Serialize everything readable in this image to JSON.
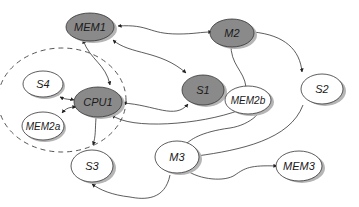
{
  "diagram": {
    "colors": {
      "filled_node": "#8a8a8a",
      "empty_node": "#ffffff",
      "stroke": "#333333",
      "shadow": "#b5b5b5",
      "cluster_border": "#555555"
    },
    "cluster": {
      "name": "cpu1-cluster",
      "members": [
        "S4",
        "CPU1",
        "MEM2a"
      ],
      "style": "dashed"
    },
    "nodes": {
      "MEM1": {
        "label": "MEM1",
        "filled": true
      },
      "M2": {
        "label": "M2",
        "filled": true
      },
      "S4": {
        "label": "S4",
        "filled": false
      },
      "CPU1": {
        "label": "CPU1",
        "filled": true
      },
      "S1": {
        "label": "S1",
        "filled": true
      },
      "MEM2b": {
        "label": "MEM2b",
        "filled": false
      },
      "S2": {
        "label": "S2",
        "filled": false
      },
      "MEM2a": {
        "label": "MEM2a",
        "filled": false
      },
      "S3": {
        "label": "S3",
        "filled": false
      },
      "M3": {
        "label": "M3",
        "filled": false
      },
      "MEM3": {
        "label": "MEM3",
        "filled": false
      }
    },
    "edges": [
      {
        "from": "MEM1",
        "to": "M2",
        "bidirectional": true
      },
      {
        "from": "MEM1",
        "to": "CPU1",
        "bidirectional": true
      },
      {
        "from": "MEM1",
        "to": "S1",
        "bidirectional": true
      },
      {
        "from": "M2",
        "to": "S2",
        "bidirectional": false
      },
      {
        "from": "MEM2b",
        "to": "M2",
        "bidirectional": false
      },
      {
        "from": "S1",
        "to": "CPU1",
        "bidirectional": true
      },
      {
        "from": "CPU1",
        "to": "MEM2b",
        "bidirectional": true
      },
      {
        "from": "S4",
        "to": "CPU1",
        "bidirectional": true
      },
      {
        "from": "MEM2a",
        "to": "CPU1",
        "bidirectional": true
      },
      {
        "from": "CPU1",
        "to": "S3",
        "bidirectional": false
      },
      {
        "from": "S2",
        "to": "M3",
        "bidirectional": false
      },
      {
        "from": "M3",
        "to": "S3",
        "bidirectional": false
      },
      {
        "from": "M3",
        "to": "MEM3",
        "bidirectional": true
      },
      {
        "from": "MEM2b",
        "to": "M3",
        "bidirectional": false
      }
    ]
  }
}
